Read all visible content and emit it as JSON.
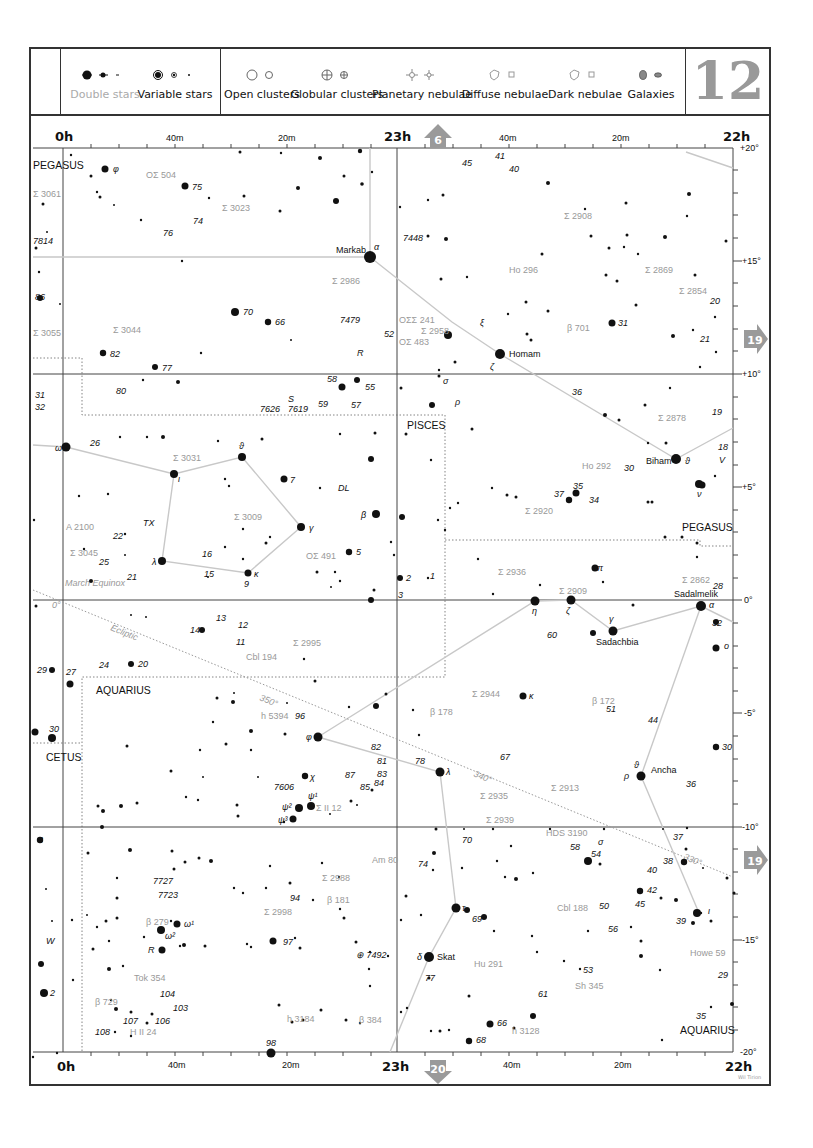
{
  "chart_number": "12",
  "legend": {
    "items": [
      {
        "label": "Double stars",
        "icon": "double-star-icon",
        "muted": true
      },
      {
        "label": "Variable stars",
        "icon": "variable-star-icon"
      },
      {
        "label": "Open clusters",
        "icon": "open-cluster-icon"
      },
      {
        "label": "Globular clusters",
        "icon": "globular-cluster-icon"
      },
      {
        "label": "Planetary nebulae",
        "icon": "planetary-nebula-icon"
      },
      {
        "label": "Diffuse nebulae",
        "icon": "diffuse-nebula-icon"
      },
      {
        "label": "Dark nebulae",
        "icon": "dark-nebula-icon"
      },
      {
        "label": "Galaxies",
        "icon": "galaxy-icon"
      }
    ]
  },
  "axes": {
    "top_ra": [
      "0h",
      "40m",
      "20m",
      "23h",
      "40m",
      "20m",
      "22h"
    ],
    "bottom_ra": [
      "0h",
      "40m",
      "20m",
      "23h",
      "40m",
      "20m",
      "22h"
    ],
    "dec": [
      "+20°",
      "+15°",
      "+10°",
      "+5°",
      "0°",
      "-5°",
      "-10°",
      "-15°",
      "-20°"
    ]
  },
  "nav_arrows": {
    "up": "6",
    "right_top": "19",
    "right_bottom": "19",
    "down": "20"
  },
  "constellations": [
    "PEGASUS",
    "PISCES",
    "PEGASUS",
    "AQUARIUS",
    "CETUS",
    "AQUARIUS"
  ],
  "ecliptic": {
    "label": "Ecliptic",
    "marks": [
      "0°",
      "350°",
      "340°",
      "330°"
    ],
    "equinox": "March Equinox"
  },
  "named_stars": [
    "Markab",
    "Homam",
    "Biham",
    "Sadalmelik",
    "Sadachbia",
    "Ancha",
    "Skat"
  ],
  "credit": "Wil Tirion",
  "colors": {
    "frame": "#333333",
    "muted": "#999999",
    "arrow": "#9a9a9a",
    "lines": "#c8c8c8"
  }
}
